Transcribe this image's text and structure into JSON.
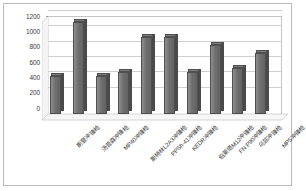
{
  "chart_data": {
    "type": "bar",
    "title": "",
    "subtitle": "",
    "xlabel": "",
    "ylabel": "",
    "ylim": [
      0,
      1200
    ],
    "y_ticks": [
      0,
      200,
      400,
      600,
      800,
      1000,
      1200
    ],
    "grid": true,
    "legend": false,
    "legend_position": "none",
    "style": "3d-column",
    "bar_color": "#6f6f6f",
    "categories": [
      "斯登冲锋枪",
      "汤普森冲锋枪",
      "MP40冲锋枪",
      "斯特林L2A3冲锋枪",
      "PPSh-41冲锋枪",
      "KEDR冲锋枪",
      "伯莱塔M12冲锋枪",
      "FN P90冲锋枪",
      "乌兹冲锋枪",
      "MP5冲锋枪"
    ],
    "values": [
      500,
      1200,
      500,
      550,
      1000,
      1000,
      550,
      900,
      600,
      800
    ]
  },
  "colors": {
    "bar_fill": "#6f6f6f",
    "bar_edge": "#4f4f4f",
    "gridline": "#cfcfcf",
    "frame": "#b9b9b9",
    "text": "#3a3a3a",
    "background": "#ffffff"
  }
}
